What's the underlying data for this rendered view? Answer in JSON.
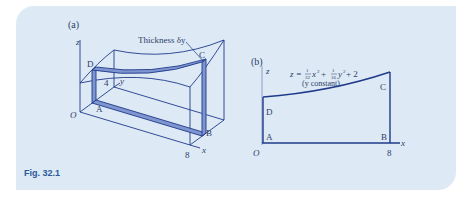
{
  "figure": {
    "caption": "Fig. 32.1",
    "panel_a": {
      "label": "(a)",
      "annotation": "Thickness δy",
      "axis_z": "z",
      "axis_y": "y",
      "axis_x": "x",
      "origin": "O",
      "y_tick": "4",
      "x_tick": "8",
      "points": {
        "A": "A",
        "B": "B",
        "C": "C",
        "D": "D"
      }
    },
    "panel_b": {
      "label": "(b)",
      "equation_prefix": "z = ",
      "frac1_num": "1",
      "frac1_den": "32",
      "term1": "x",
      "exp1": "2",
      "plus1": " + ",
      "frac2_num": "1",
      "frac2_den": "16",
      "term2": "y",
      "exp2": "2",
      "tail": " + 2",
      "equation_note": "(y constant)",
      "axis_z": "z",
      "axis_x": "x",
      "origin": "O",
      "x_tick": "8",
      "points": {
        "A": "A",
        "B": "B",
        "C": "C",
        "D": "D"
      }
    },
    "colors": {
      "panel_bg": "#dde9f5",
      "line": "#1f3a8a",
      "strip_fill": "#7f95cf",
      "caption": "#2b5a9a"
    }
  }
}
